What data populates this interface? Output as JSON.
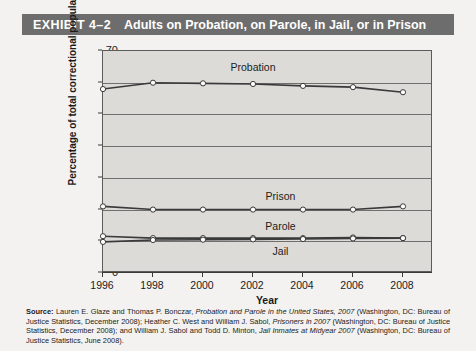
{
  "header": {
    "exhibit_label": "EXHIBIT 4–2",
    "title": "Adults on Probation, on Parole, in Jail, or in Prison"
  },
  "chart_data": {
    "type": "line",
    "title": "Adults on Probation, on Parole, in Jail, or in Prison",
    "xlabel": "Year",
    "ylabel": "Percentage of total correctional population",
    "x": [
      1996,
      1998,
      2000,
      2002,
      2004,
      2006,
      2008
    ],
    "categories": [
      "1996",
      "1998",
      "2000",
      "2002",
      "2004",
      "2006",
      "2008"
    ],
    "xlim": [
      1996,
      2009.2
    ],
    "ylim": [
      0,
      70
    ],
    "ytick_values": [
      0,
      10,
      20,
      30,
      40,
      50,
      60,
      70
    ],
    "ytick_labels": [
      "0",
      "10",
      "20",
      "30",
      "40",
      "50",
      "60",
      "70"
    ],
    "grid": true,
    "legend": "inline-labels",
    "series": [
      {
        "name": "Probation",
        "values": [
          58.0,
          60.0,
          59.8,
          59.6,
          59.0,
          58.6,
          57.0
        ],
        "label_x": 2002,
        "label_y": 64.5
      },
      {
        "name": "Prison",
        "values": [
          21.0,
          20.0,
          20.0,
          20.0,
          20.0,
          20.0,
          21.0
        ],
        "label_x": 2003.1,
        "label_y": 24.0
      },
      {
        "name": "Parole",
        "values": [
          11.6,
          11.0,
          11.0,
          11.0,
          11.0,
          11.2,
          11.0
        ],
        "label_x": 2003.1,
        "label_y": 14.5
      },
      {
        "name": "Jail",
        "values": [
          9.8,
          10.4,
          10.5,
          10.6,
          10.7,
          10.9,
          11.0
        ],
        "label_x": 2003.1,
        "label_y": 6.6
      }
    ],
    "colors": {
      "line": "#3a3a3a",
      "marker_fill": "#ffffff",
      "plot_background": "#dcdbd8",
      "grid": "#6f6f6f",
      "title_bar": "#6d6d6d"
    }
  },
  "source": {
    "label": "Source:",
    "text": " Lauren E. Glaze and Thomas P. Bonczar, Probation and Parole in the United States, 2007 (Washington, DC: Bureau of Justice Statistics, December 2008); Heather C. West and William J. Sabol, Prisoners in 2007 (Washington, DC: Bureau of Justice Statistics, December 2008); and William J. Sabol and Todd D. Minton, Jail Inmates at Midyear 2007 (Washington, DC: Bureau of Justice Statistics, June 2008)."
  }
}
